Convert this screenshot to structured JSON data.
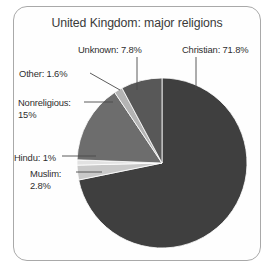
{
  "figure": {
    "frame_border_color": "#a9a9a9",
    "background": "#ffffff"
  },
  "chart_data": {
    "type": "pie",
    "title": "United Kingdom: major religions",
    "xlabel": "",
    "ylabel": "",
    "legend_position": "none",
    "grid": false,
    "start_angle_deg": 0,
    "direction": "clockwise",
    "categories": [
      "Christian",
      "Muslim",
      "Hindu",
      "Nonreligious",
      "Other",
      "Unknown"
    ],
    "values": [
      71.8,
      2.8,
      1.0,
      15.0,
      1.6,
      7.8
    ],
    "units": "percent",
    "colors": [
      "#3f3f3f",
      "#c9c9c9",
      "#e2e2e2",
      "#6d6d6d",
      "#b4b4b4",
      "#585858"
    ],
    "slices": [
      {
        "name": "Christian",
        "value": 71.8,
        "label": "Christian: 71.8%",
        "color": "#3f3f3f"
      },
      {
        "name": "Muslim",
        "value": 2.8,
        "label": "Muslim: 2.8%",
        "color": "#c9c9c9"
      },
      {
        "name": "Hindu",
        "value": 1.0,
        "label": "Hindu: 1%",
        "color": "#e2e2e2"
      },
      {
        "name": "Nonreligious",
        "value": 15.0,
        "label": "Nonreligious: 15%",
        "color": "#6d6d6d"
      },
      {
        "name": "Other",
        "value": 1.6,
        "label": "Other: 1.6%",
        "color": "#b4b4b4"
      },
      {
        "name": "Unknown",
        "value": 7.8,
        "label": "Unknown: 7.8%",
        "color": "#585858"
      }
    ]
  },
  "labels": {
    "christian": "Christian: 71.8%",
    "unknown": "Unknown: 7.8%",
    "other": "Other: 1.6%",
    "nonreligious_line1": "Nonreligious:",
    "nonreligious_line2": "15%",
    "hindu": "Hindu: 1%",
    "muslim_line1": "Muslim:",
    "muslim_line2": "2.8%"
  }
}
